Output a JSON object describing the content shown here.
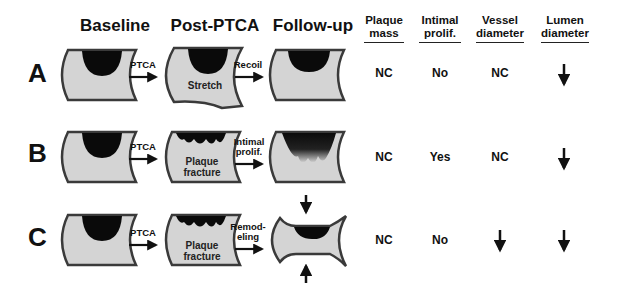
{
  "figure": {
    "stage_headers": [
      "Baseline",
      "Post-PTCA",
      "Follow-up"
    ],
    "table_headers": [
      {
        "line1": "Plaque",
        "line2": "mass"
      },
      {
        "line1": "Intimal",
        "line2": "prolif."
      },
      {
        "line1": "Vessel",
        "line2": "diameter"
      },
      {
        "line1": "Lumen",
        "line2": "diameter"
      }
    ],
    "rows": [
      {
        "label": "A",
        "arrow1": "PTCA",
        "post_label": "Stretch",
        "arrow2": "Recoil",
        "plaque_mass": "NC",
        "intimal_prolif": "No",
        "vessel_diameter": "NC",
        "lumen_diameter": "decrease-arrow"
      },
      {
        "label": "B",
        "arrow1": "PTCA",
        "post_label_1": "Plaque",
        "post_label_2": "fracture",
        "arrow2_1": "Intimal",
        "arrow2_2": "prolif.",
        "plaque_mass": "NC",
        "intimal_prolif": "Yes",
        "vessel_diameter": "NC",
        "lumen_diameter": "decrease-arrow"
      },
      {
        "label": "C",
        "arrow1": "PTCA",
        "post_label_1": "Plaque",
        "post_label_2": "fracture",
        "arrow2_1": "Remod-",
        "arrow2_2": "eling",
        "plaque_mass": "NC",
        "intimal_prolif": "No",
        "vessel_diameter": "decrease-arrow",
        "lumen_diameter": "decrease-arrow"
      }
    ],
    "colors": {
      "vessel_fill": "#d4d4d4",
      "vessel_wall": "#3a3a3a",
      "plaque": "#0a0a0a"
    }
  }
}
